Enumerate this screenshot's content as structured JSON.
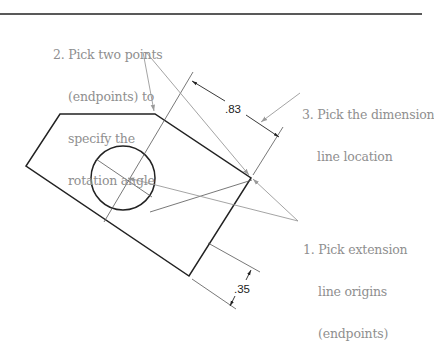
{
  "callouts": [
    {
      "id": "step1",
      "lines": [
        "1. Pick extension",
        "    line origins",
        "    (endpoints)"
      ]
    },
    {
      "id": "step2",
      "lines": [
        "2. Pick two points",
        "    (endpoints) to",
        "    specify the",
        "    rotation angle"
      ]
    },
    {
      "id": "step3",
      "lines": [
        "3. Pick the dimension",
        "    line location"
      ]
    }
  ],
  "dimensions": {
    "rotated": ".83",
    "offset": ".35"
  },
  "colors": {
    "object_line": "#222222",
    "thin_line": "#555555",
    "leader": "#9a9a9a",
    "callout_text": "#8f8f8f"
  }
}
